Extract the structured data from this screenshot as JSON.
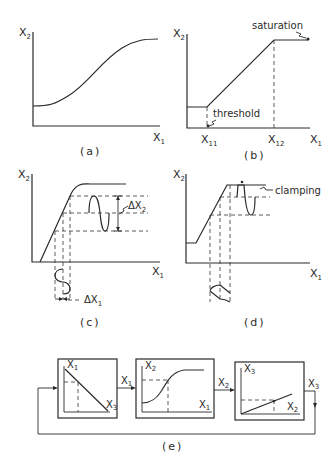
{
  "figure": {
    "panels": {
      "a": {
        "caption": "(a)",
        "y_label": "X",
        "y_sub": "2",
        "x_label": "X",
        "x_sub": "1",
        "curve": "sigmoid"
      },
      "b": {
        "caption": "(b)",
        "y_label": "X",
        "y_sub": "2",
        "x_label": "X",
        "x_sub": "1",
        "tick_1_label": "X",
        "tick_1_sub": "11",
        "tick_2_label": "X",
        "tick_2_sub": "12",
        "annotation_top": "saturation",
        "annotation_bottom": "threshold",
        "curve": "piecewise-linear"
      },
      "c": {
        "caption": "(c)",
        "y_label": "X",
        "y_sub": "2",
        "x_label": "X",
        "x_sub": "1",
        "delta_y_label": "ΔX",
        "delta_y_sub": "2",
        "delta_x_label": "ΔX",
        "delta_x_sub": "1"
      },
      "d": {
        "caption": "(d)",
        "y_label": "X",
        "y_sub": "2",
        "x_label": "X",
        "x_sub": "1",
        "annotation": "clamping"
      },
      "e": {
        "caption": "(e)",
        "blocks": [
          {
            "y_label": "X",
            "y_sub": "1",
            "x_label": "X",
            "x_sub": "3",
            "curve": "decreasing-linear"
          },
          {
            "y_label": "X",
            "y_sub": "2",
            "x_label": "X",
            "x_sub": "1",
            "curve": "sigmoid"
          },
          {
            "y_label": "X",
            "y_sub": "3",
            "x_label": "X",
            "x_sub": "2",
            "curve": "increasing-linear"
          }
        ],
        "signals": [
          {
            "label": "X",
            "sub": "1"
          },
          {
            "label": "X",
            "sub": "2"
          },
          {
            "label": "X",
            "sub": "3"
          }
        ]
      }
    }
  }
}
